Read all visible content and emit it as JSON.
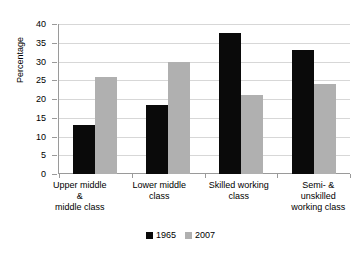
{
  "chart_data": {
    "type": "bar",
    "title": "",
    "xlabel": "",
    "ylabel": "Percentage",
    "ylim": [
      0,
      40
    ],
    "yticks": [
      0,
      5,
      10,
      15,
      20,
      25,
      30,
      35,
      40
    ],
    "grid": true,
    "legend_position": "bottom",
    "categories": [
      "Upper middle\n&\nmiddle class",
      "Lower middle\nclass",
      "Skilled working\nclass",
      "Semi- &\nunskilled\nworking class"
    ],
    "series": [
      {
        "name": "1965",
        "color": "#0a0a0a",
        "values": [
          13,
          18.5,
          37.5,
          33
        ]
      },
      {
        "name": "2007",
        "color": "#b0b0b0",
        "values": [
          26,
          30,
          21,
          24
        ]
      }
    ]
  },
  "axis": {
    "y_title": "Percentage",
    "y_tick_labels": [
      "40",
      "35",
      "30",
      "25",
      "20",
      "15",
      "10",
      "5",
      "0"
    ]
  },
  "legend": {
    "items": [
      {
        "label": "1965",
        "color": "#0a0a0a"
      },
      {
        "label": "2007",
        "color": "#b0b0b0"
      }
    ]
  },
  "colors": {
    "series_1965": "#0a0a0a",
    "series_2007": "#b0b0b0",
    "gridline": "#d7d7d7",
    "axis": "#9a9a9a",
    "background": "#ffffff"
  }
}
